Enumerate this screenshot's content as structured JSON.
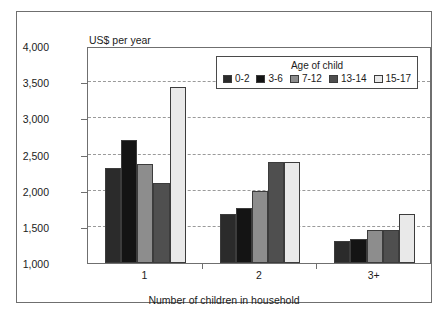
{
  "chart_data": {
    "type": "bar",
    "title": "",
    "subtitle": "",
    "xlabel": "Number of children in household",
    "ylabel": "US$ per year",
    "categories": [
      "1",
      "2",
      "3+"
    ],
    "ylim": [
      1000,
      4000
    ],
    "yticks": [
      "1,000",
      "1,500",
      "2,000",
      "2,500",
      "3,000",
      "3,500",
      "4,000"
    ],
    "ytick_values": [
      1000,
      1500,
      2000,
      2500,
      3000,
      3500,
      4000
    ],
    "grid": true,
    "legend_position": "top-right-inside",
    "legend_title": "Age of child",
    "series": [
      {
        "name": "0-2",
        "color": "#2b2b2b",
        "values": [
          2320,
          1680,
          1300
        ]
      },
      {
        "name": "3-6",
        "color": "#141414",
        "values": [
          2700,
          1760,
          1330
        ]
      },
      {
        "name": "7-12",
        "color": "#8d8d8d",
        "values": [
          2370,
          2000,
          1450
        ]
      },
      {
        "name": "13-14",
        "color": "#4f4f4f",
        "values": [
          2110,
          2400,
          1450
        ]
      },
      {
        "name": "15-17",
        "color": "#e9e9e9",
        "values": [
          3430,
          2390,
          1680
        ]
      }
    ]
  }
}
